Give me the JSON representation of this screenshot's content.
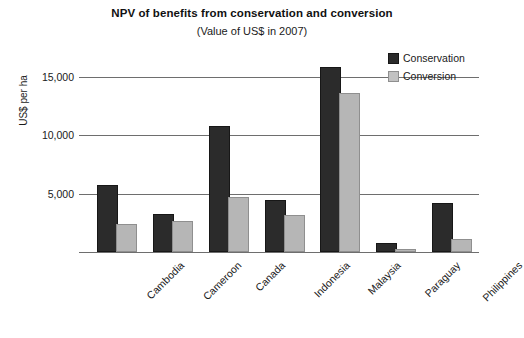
{
  "chart_data": {
    "type": "bar",
    "title": "NPV of benefits from conservation and conversion",
    "subtitle": "(Value of US$ in 2007)",
    "xlabel": "",
    "ylabel": "US$ per ha",
    "ylim": [
      0,
      16600
    ],
    "yticks": [
      5000,
      10000,
      15000
    ],
    "ytick_labels": [
      "5,000",
      "10,000",
      "15,000"
    ],
    "grid": true,
    "legend_position": "top-right",
    "categories": [
      "Cambodia",
      "Cameroon",
      "Canada",
      "Indonesia",
      "Malaysia",
      "Paraguay",
      "Philippines"
    ],
    "series": [
      {
        "name": "Conservation",
        "color": "#2b2b2b",
        "values": [
          5600,
          3100,
          10600,
          4300,
          15700,
          600,
          4000
        ]
      },
      {
        "name": "Conversion",
        "color": "#b6b6b6",
        "values": [
          2200,
          2500,
          4500,
          3000,
          13400,
          100,
          900
        ]
      }
    ]
  },
  "legend": {
    "items": [
      {
        "label": "Conservation",
        "swatch": "conservation"
      },
      {
        "label": "Conversion",
        "swatch": "conversion"
      }
    ]
  }
}
